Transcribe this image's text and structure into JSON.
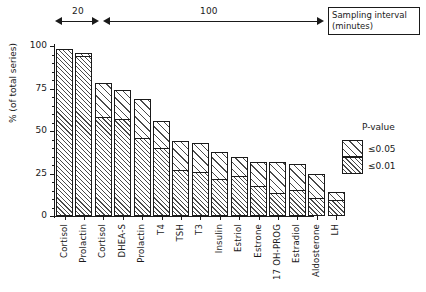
{
  "figure": {
    "interval_band": {
      "short_label": "20",
      "long_label": "100",
      "box_line1": "Sampling interval",
      "box_line2": "(minutes)"
    },
    "legend": {
      "title": "P-value",
      "entries": [
        {
          "label": "≤0.05",
          "key": "p05"
        },
        {
          "label": "≤0.01",
          "key": "p01"
        }
      ]
    }
  },
  "chart_data": {
    "type": "bar",
    "title": "",
    "subtitle": "",
    "xlabel": "",
    "ylabel": "% (of total series)",
    "ylim": [
      0,
      100
    ],
    "yticks": [
      0,
      25,
      50,
      75,
      100
    ],
    "ytick_labels": [
      "0",
      "25",
      "50",
      "75",
      "100"
    ],
    "yminor_step": 5,
    "grid": false,
    "stacked": true,
    "legend_position": "right",
    "categories": [
      "Cortisol",
      "Prolactin",
      "Cortisol",
      "DHEA-S",
      "Prolactin",
      "T4",
      "TSH",
      "T3",
      "Insulin",
      "Estriol",
      "Estrone",
      "17 OH-PROG",
      "Estradiol",
      "Aldosterone",
      "LH"
    ],
    "sampling_interval_minutes": [
      20,
      20,
      100,
      100,
      100,
      100,
      100,
      100,
      100,
      100,
      100,
      100,
      100,
      100,
      100
    ],
    "series": [
      {
        "name": "≤0.01",
        "key": "p01",
        "values": [
          98,
          94,
          58,
          57,
          46,
          40,
          27,
          26,
          22,
          23.5,
          17.5,
          13.5,
          15.5,
          10.5,
          9.5
        ]
      },
      {
        "name": "≤0.05",
        "key": "p05",
        "values": [
          0,
          2,
          20,
          17,
          23,
          16,
          17,
          17,
          15.5,
          11,
          14,
          18.5,
          15,
          14.5,
          4.5
        ]
      }
    ],
    "totals": [
      98,
      96,
      78,
      74,
      69,
      56,
      44,
      43,
      37.5,
      34.5,
      31.5,
      32,
      30.5,
      25,
      14
    ],
    "annotations": [
      {
        "text": "20",
        "describes": "sampling interval for first 2 bars"
      },
      {
        "text": "100",
        "describes": "sampling interval for remaining 13 bars"
      },
      {
        "text": "Sampling interval (minutes)",
        "describes": "axis caption box"
      }
    ]
  }
}
